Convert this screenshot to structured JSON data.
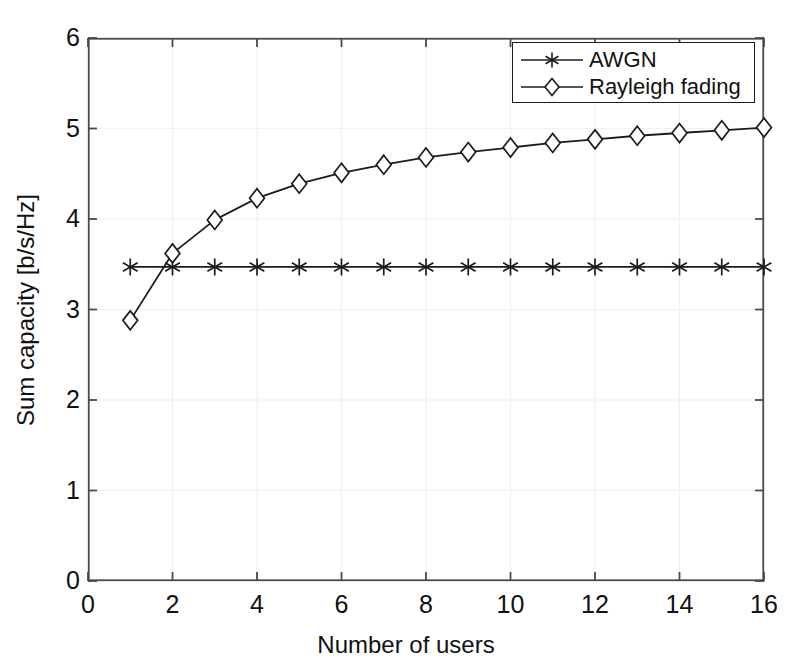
{
  "chart_data": {
    "type": "line",
    "title": "",
    "xlabel": "Number of users",
    "ylabel": "Sum capacity [b/s/Hz]",
    "xlim": [
      0,
      16
    ],
    "ylim": [
      0,
      6
    ],
    "xticks": [
      "0",
      "2",
      "4",
      "6",
      "8",
      "10",
      "12",
      "14",
      "16"
    ],
    "xtick_values": [
      0,
      2,
      4,
      6,
      8,
      10,
      12,
      14,
      16
    ],
    "yticks": [
      "0",
      "1",
      "2",
      "3",
      "4",
      "5",
      "6"
    ],
    "ytick_values": [
      0,
      1,
      2,
      3,
      4,
      5,
      6
    ],
    "grid": true,
    "legend_position": "top-right",
    "x": [
      1,
      2,
      3,
      4,
      5,
      6,
      7,
      8,
      9,
      10,
      11,
      12,
      13,
      14,
      15,
      16
    ],
    "series": [
      {
        "name": "AWGN",
        "marker": "asterisk",
        "color": "#1b1b1b",
        "values": [
          3.47,
          3.47,
          3.47,
          3.47,
          3.47,
          3.47,
          3.47,
          3.47,
          3.47,
          3.47,
          3.47,
          3.47,
          3.47,
          3.47,
          3.47,
          3.47
        ]
      },
      {
        "name": "Rayleigh fading",
        "marker": "diamond",
        "color": "#1b1b1b",
        "values": [
          2.88,
          3.62,
          3.99,
          4.23,
          4.39,
          4.51,
          4.6,
          4.68,
          4.74,
          4.79,
          4.84,
          4.88,
          4.92,
          4.95,
          4.98,
          5.01
        ]
      }
    ]
  },
  "legend": {
    "items": [
      {
        "label": "AWGN",
        "marker": "asterisk"
      },
      {
        "label": "Rayleigh fading",
        "marker": "diamond"
      }
    ]
  },
  "axes": {
    "x_title": "Number of users",
    "y_title": "Sum capacity [b/s/Hz]"
  },
  "colors": {
    "line": "#1b1b1b",
    "axis": "#4a4a4a",
    "grid": "#f0f0f0",
    "background": "#ffffff",
    "text": "#111111"
  }
}
